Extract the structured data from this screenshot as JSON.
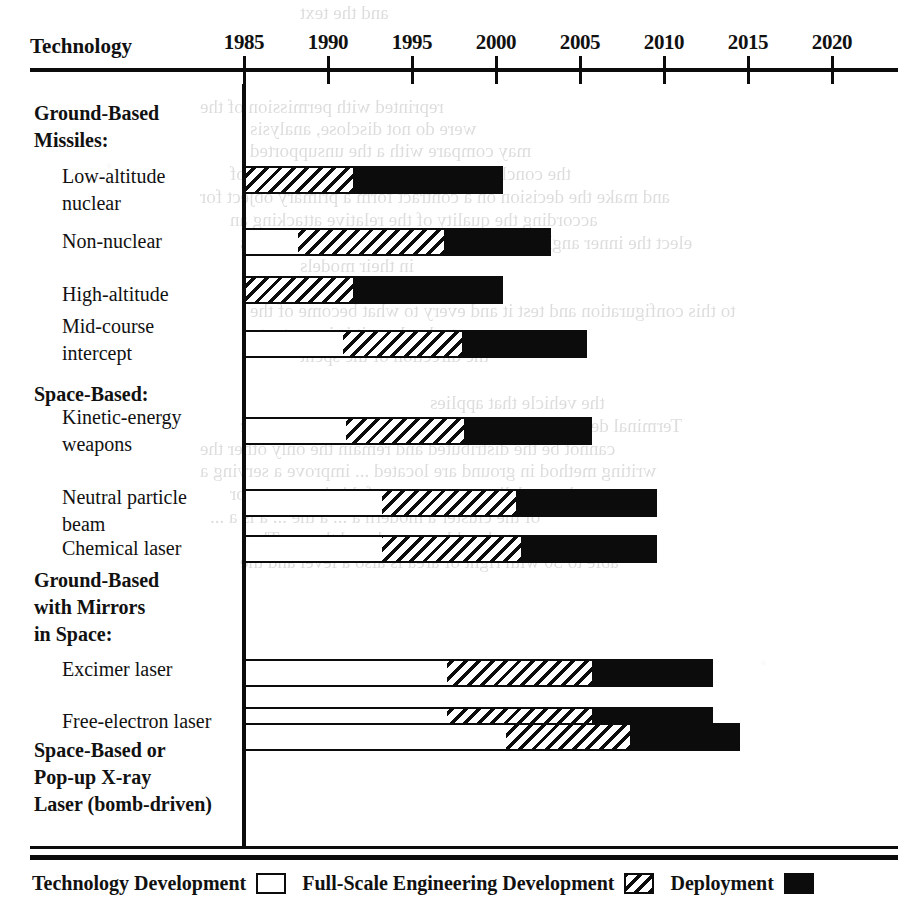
{
  "header": {
    "row_header_label": "Technology"
  },
  "axis": {
    "ticks": [
      {
        "label": "1985",
        "year": 1985
      },
      {
        "label": "1990",
        "year": 1990
      },
      {
        "label": "1995",
        "year": 1995
      },
      {
        "label": "2000",
        "year": 2000
      },
      {
        "label": "2005",
        "year": 2005
      },
      {
        "label": "2010",
        "year": 2010
      },
      {
        "label": "2015",
        "year": 2015
      },
      {
        "label": "2020",
        "year": 2020
      }
    ],
    "min_year": 1985,
    "max_year": 2020
  },
  "legend": {
    "items": [
      {
        "label": "Technology Development",
        "swatch": "white-box-swatch",
        "style": "white"
      },
      {
        "label": "Full-Scale Engineering Development",
        "swatch": "hatched-box-swatch",
        "style": "hatch"
      },
      {
        "label": "Deployment",
        "swatch": "black-box-swatch",
        "style": "black"
      }
    ]
  },
  "groups": [
    {
      "label": "Ground-Based\nMissiles:"
    },
    {
      "label": "Space-Based:"
    },
    {
      "label": "Ground-Based\nwith Mirrors\nin Space:"
    },
    {
      "label": "Space-Based or\nPop-up X-ray\nLaser (bomb-driven)"
    }
  ],
  "rows": [
    {
      "label": "Low-altitude\nnuclear"
    },
    {
      "label": "Non-nuclear"
    },
    {
      "label": "High-altitude"
    },
    {
      "label": "Mid-course\nintercept"
    },
    {
      "label": "Kinetic-energy\nweapons"
    },
    {
      "label": "Neutral particle\nbeam"
    },
    {
      "label": "Chemical laser"
    },
    {
      "label": "Excimer laser"
    },
    {
      "label": "Free-electron laser"
    },
    {
      "label": "Space-Based or Pop-up X-ray Laser (bomb-driven)"
    }
  ],
  "chart_data": {
    "type": "bar",
    "title": "",
    "xlabel": "",
    "ylabel": "Technology",
    "orientation": "horizontal",
    "stacked": true,
    "grid": false,
    "legend_position": "bottom",
    "xlim": [
      1985,
      2020
    ],
    "xticks": [
      1985,
      1990,
      1995,
      2000,
      2005,
      2010,
      2015,
      2020
    ],
    "series": [
      {
        "name": "Technology Development",
        "style": "white"
      },
      {
        "name": "Full-Scale Engineering Development",
        "style": "hatch"
      },
      {
        "name": "Deployment",
        "style": "black"
      }
    ],
    "categories": [
      "Low-altitude nuclear",
      "Non-nuclear",
      "High-altitude",
      "Mid-course intercept",
      "Kinetic-energy weapons",
      "Neutral particle beam",
      "Chemical laser",
      "Excimer laser",
      "Free-electron laser",
      "Space-Based or Pop-up X-ray Laser (bomb-driven)"
    ],
    "bars": [
      {
        "category": "Low-altitude nuclear",
        "tech_dev": [
          1985.0,
          1985.0
        ],
        "fsed": [
          1985.0,
          1991.5
        ],
        "deployment": [
          1991.5,
          2000.4
        ]
      },
      {
        "category": "Non-nuclear",
        "tech_dev": [
          1985.0,
          1988.2
        ],
        "fsed": [
          1988.2,
          1996.9
        ],
        "deployment": [
          1996.9,
          2003.3
        ]
      },
      {
        "category": "High-altitude",
        "tech_dev": [
          1985.0,
          1985.0
        ],
        "fsed": [
          1985.0,
          1991.5
        ],
        "deployment": [
          1991.5,
          2000.4
        ]
      },
      {
        "category": "Mid-course intercept",
        "tech_dev": [
          1985.0,
          1990.9
        ],
        "fsed": [
          1990.9,
          1998.0
        ],
        "deployment": [
          1998.0,
          2005.4
        ]
      },
      {
        "category": "Kinetic-energy weapons",
        "tech_dev": [
          1985.0,
          1991.1
        ],
        "fsed": [
          1991.1,
          1998.1
        ],
        "deployment": [
          1998.1,
          2005.7
        ]
      },
      {
        "category": "Neutral particle beam",
        "tech_dev": [
          1985.0,
          1993.2
        ],
        "fsed": [
          1993.2,
          2001.2
        ],
        "deployment": [
          2001.2,
          2009.6
        ]
      },
      {
        "category": "Chemical laser",
        "tech_dev": [
          1985.0,
          1993.2
        ],
        "fsed": [
          1993.2,
          2001.5
        ],
        "deployment": [
          2001.5,
          2009.6
        ]
      },
      {
        "category": "Excimer laser",
        "tech_dev": [
          1985.0,
          1997.1
        ],
        "fsed": [
          1997.1,
          2005.7
        ],
        "deployment": [
          2005.7,
          2012.9
        ]
      },
      {
        "category": "Free-electron laser",
        "tech_dev": [
          1985.0,
          1997.1
        ],
        "fsed": [
          1997.1,
          2005.7
        ],
        "deployment": [
          2005.7,
          2012.9
        ]
      },
      {
        "category": "Space-Based or Pop-up X-ray Laser (bomb-driven)",
        "tech_dev": [
          1985.0,
          2000.6
        ],
        "fsed": [
          2000.6,
          2008.0
        ],
        "deployment": [
          2008.0,
          2014.5
        ]
      }
    ]
  },
  "bleed_text": [
    "and the text",
    "reprinted with permission of the",
    "were do not disclose, analysis",
    "may compare with a the unsupported",
    "the conclusion, most of all the dimensions of",
    "and make the decision on a contract form a primary object for",
    "according the quality of the relative attacking an",
    "elect the inner angle of the opposite an multiple approaches",
    "in their models",
    "to this configuration and test it and every to what become of the",
    "technology it is important",
    "the direction of the spent",
    "the vehicle that applies",
    "Terminal defence, this technology to all, long the strategic",
    "cannot be the distributed and remain the only other the",
    "writing method in ground are located ... improve a serving a",
    "a beam delivery an enemy of this is to count or",
    "of the cluster a modern a ... a the ... a is a ...",
    "to be able to reach and then ... The",
    "able to 30 with right of area is also a level and the"
  ]
}
